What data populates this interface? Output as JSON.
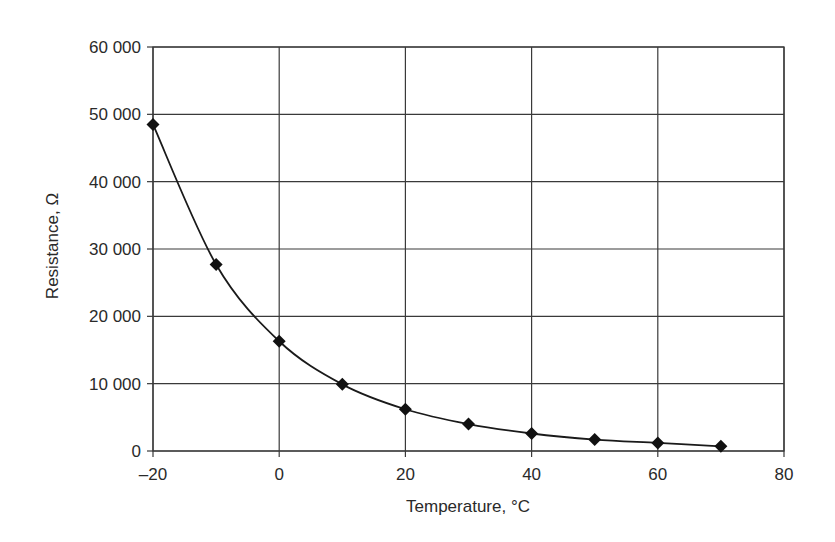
{
  "chart_data": {
    "type": "line",
    "title": "",
    "xlabel": "Temperature, °C",
    "ylabel": "Resistance, Ω",
    "xlim": [
      -20,
      80
    ],
    "ylim": [
      0,
      60000
    ],
    "x_ticks": [
      -20,
      0,
      20,
      40,
      60,
      80
    ],
    "x_tick_labels": [
      "–20",
      "0",
      "20",
      "40",
      "60",
      "80"
    ],
    "y_ticks": [
      0,
      10000,
      20000,
      30000,
      40000,
      50000,
      60000
    ],
    "y_tick_labels": [
      "0",
      "10 000",
      "20 000",
      "30 000",
      "40 000",
      "50 000",
      "60 000"
    ],
    "grid": true,
    "legend": null,
    "marker": "diamond",
    "line_style": "smooth",
    "series": [
      {
        "name": "Resistance",
        "x": [
          -20,
          -10,
          0,
          10,
          20,
          30,
          40,
          50,
          60,
          70
        ],
        "values": [
          48500,
          27700,
          16300,
          9900,
          6200,
          4000,
          2600,
          1700,
          1200,
          700
        ]
      }
    ]
  },
  "colors": {
    "line": "#1a1a1a",
    "grid": "#3a3a3a",
    "background": "#ffffff"
  }
}
